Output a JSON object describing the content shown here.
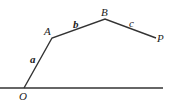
{
  "diagram": {
    "points": {
      "O": {
        "label": "O",
        "x": 24,
        "y": 88
      },
      "A": {
        "label": "A",
        "x": 52,
        "y": 38
      },
      "B": {
        "label": "B",
        "x": 105,
        "y": 19
      },
      "P": {
        "label": "P",
        "x": 156,
        "y": 38
      }
    },
    "segments": [
      {
        "from": "O",
        "to": "A",
        "label": "a"
      },
      {
        "from": "A",
        "to": "B",
        "label": "b"
      },
      {
        "from": "B",
        "to": "P",
        "label": "c"
      }
    ],
    "baseline": {
      "x1": 0,
      "x2": 163,
      "y": 88
    },
    "colors": {
      "line": "#333333",
      "text": "#222222",
      "background": "#ffffff"
    }
  }
}
